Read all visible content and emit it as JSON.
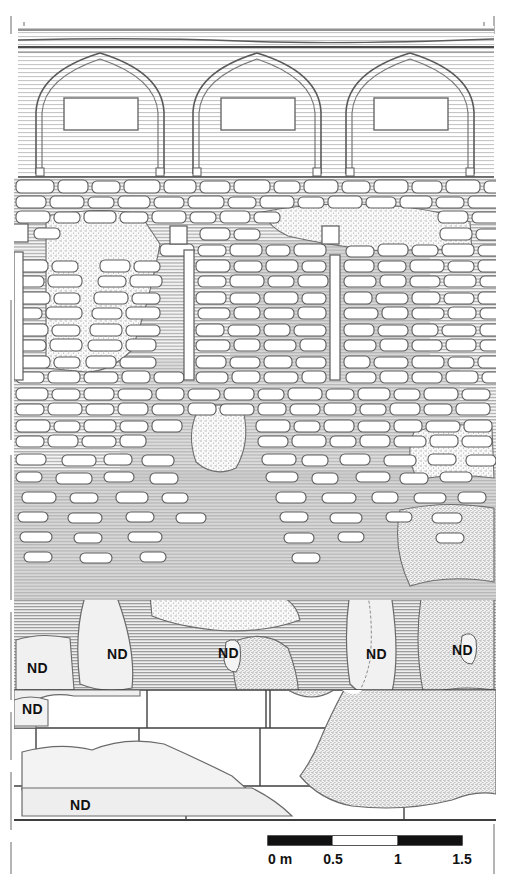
{
  "drawing": {
    "type": "archaeological-wall-elevation",
    "title": "",
    "frame": {
      "left_tick_line": true,
      "top_tick_line": true,
      "right_tick_line": true,
      "style": "dashed-registration-line"
    },
    "bands": [
      {
        "name": "upper-arcade",
        "y_top": 18,
        "y_bottom": 178,
        "fill": "horizontal-hatch-light",
        "description": "Three pointed Gothic blind arches with rectangular panels"
      },
      {
        "name": "rubble-masonry-upper",
        "y_top": 178,
        "y_bottom": 390,
        "fill": "stone-rubble-on-hatch",
        "description": "Irregular rubble masonry with vertical beam slots and putlog holes"
      },
      {
        "name": "rubble-masonry-lower",
        "y_top": 390,
        "y_bottom": 600,
        "fill": "stone-rubble-on-hatch",
        "description": "Sparser rubble with plaster patches"
      },
      {
        "name": "plaster-and-render",
        "y_top": 600,
        "y_bottom": 690,
        "fill": "grey-hatch-with-stipple",
        "description": "Render / plaster zone annotated ND"
      },
      {
        "name": "ashlar-socle",
        "y_top": 690,
        "y_bottom": 822,
        "fill": "white-ashlar-blocks",
        "description": "Large dressed ashlar blocks forming base course"
      }
    ],
    "arches": [
      {
        "id": "arch-1",
        "cx": 100,
        "apex_y": 52,
        "springline_y": 172,
        "half_width": 63,
        "panel": {
          "x": 64,
          "y": 98,
          "w": 74,
          "h": 32
        }
      },
      {
        "id": "arch-2",
        "cx": 257,
        "apex_y": 52,
        "springline_y": 172,
        "half_width": 63,
        "panel": {
          "x": 221,
          "y": 98,
          "w": 74,
          "h": 32
        }
      },
      {
        "id": "arch-3",
        "cx": 410,
        "apex_y": 52,
        "springline_y": 172,
        "half_width": 63,
        "panel": {
          "x": 374,
          "y": 98,
          "w": 74,
          "h": 32
        }
      }
    ],
    "beam_slots": [
      {
        "id": "slot-1",
        "x": 14,
        "y": 252,
        "w": 9,
        "h": 128
      },
      {
        "id": "slot-2",
        "x": 184,
        "y": 250,
        "w": 10,
        "h": 130
      },
      {
        "id": "slot-3",
        "x": 330,
        "y": 255,
        "w": 10,
        "h": 125
      }
    ],
    "putlog_holes": [
      {
        "id": "hole-1",
        "x": 12,
        "y": 224,
        "w": 16,
        "h": 18
      },
      {
        "id": "hole-2",
        "x": 170,
        "y": 226,
        "w": 17,
        "h": 18
      },
      {
        "id": "hole-3",
        "x": 322,
        "y": 226,
        "w": 17,
        "h": 18
      }
    ],
    "column_base": {
      "id": "column-base",
      "x": 352,
      "y": 560,
      "w": 34,
      "h": 22,
      "description": "small column base / capital fragment"
    },
    "nd_labels": [
      {
        "id": "nd-1",
        "text": "ND",
        "x": 27,
        "y": 673
      },
      {
        "id": "nd-2",
        "text": "ND",
        "x": 107,
        "y": 659
      },
      {
        "id": "nd-3",
        "text": "ND",
        "x": 22,
        "y": 714
      },
      {
        "id": "nd-4",
        "text": "ND",
        "x": 232,
        "y": 654
      },
      {
        "id": "nd-5",
        "text": "ND",
        "x": 381,
        "y": 655
      },
      {
        "id": "nd-6",
        "text": "ND",
        "x": 466,
        "y": 651
      },
      {
        "id": "nd-7",
        "text": "ND",
        "x": 82,
        "y": 805
      }
    ],
    "legend": {
      "nd_abbreviation": "ND"
    }
  },
  "scalebar": {
    "unit_label": "0 m",
    "ticks": [
      "0 m",
      "0.5",
      "1",
      "1.5"
    ],
    "x_start": 268,
    "x_end": 462,
    "y": 836,
    "height": 9,
    "segments": 3,
    "colors": {
      "fill_dark": "#111111",
      "fill_light": "#ffffff",
      "stroke": "#111111"
    }
  },
  "colors": {
    "ink": "#3a3a3a",
    "ink_strong": "#1a1a1a",
    "hatch_light": "#d8d8d8",
    "hatch_mid": "#bdbdbd",
    "stone_fill": "#ffffff",
    "plaster_fill": "#eeeeee",
    "stipple": "#c9c9c9",
    "paper": "#ffffff"
  }
}
